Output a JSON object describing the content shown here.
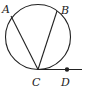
{
  "diagram": {
    "type": "geometry",
    "colors": {
      "stroke": "#222222",
      "background": "#ffffff"
    },
    "circle": {
      "cx": 38,
      "cy": 37,
      "r": 32.5
    },
    "points": {
      "A": {
        "label": "A",
        "x": 11,
        "y": 16,
        "label_x": 2,
        "label_y": 13
      },
      "B": {
        "label": "B",
        "x": 57,
        "y": 11,
        "label_x": 61,
        "label_y": 14
      },
      "C": {
        "label": "C",
        "x": 38,
        "y": 69.5,
        "label_x": 32,
        "label_y": 86
      },
      "D": {
        "label": "D",
        "x": 67,
        "y": 69.5,
        "label_x": 61,
        "label_y": 86
      }
    },
    "segments": [
      {
        "name": "CA",
        "from": "C",
        "to": "A"
      },
      {
        "name": "CB",
        "from": "C",
        "to": "B"
      }
    ],
    "tangent_line": {
      "from_x": 38,
      "to_x": 82,
      "y": 69.5,
      "through": "D"
    }
  }
}
